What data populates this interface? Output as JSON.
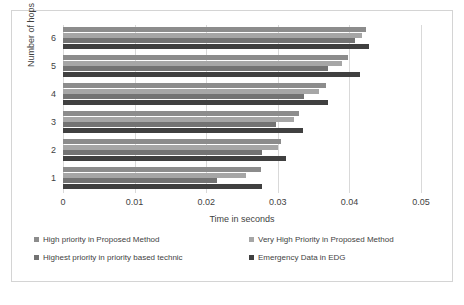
{
  "chart_data": {
    "type": "bar",
    "orientation": "horizontal",
    "title": "",
    "xlabel": "Time in seconds",
    "ylabel": "Number  of hops",
    "categories": [
      "1",
      "2",
      "3",
      "4",
      "5",
      "6"
    ],
    "xlim": [
      0,
      0.05
    ],
    "xticks": [
      "0",
      "0.01",
      "0.02",
      "0.03",
      "0.04",
      "0.05"
    ],
    "xtick_values": [
      0,
      0.01,
      0.02,
      0.03,
      0.04,
      0.05
    ],
    "grid": true,
    "legend_position": "bottom",
    "series": [
      {
        "name": "High priority in Proposed Method",
        "color": "#8c8c8c",
        "values": [
          0.0277,
          0.0305,
          0.033,
          0.0368,
          0.0398,
          0.0423
        ]
      },
      {
        "name": "Very High Priority in Proposed Method",
        "color": "#a6a6a6",
        "values": [
          0.0255,
          0.03,
          0.0323,
          0.0358,
          0.039,
          0.0418
        ]
      },
      {
        "name": "Highest priority in priority based technic",
        "color": "#737373",
        "values": [
          0.0215,
          0.0278,
          0.0298,
          0.0337,
          0.037,
          0.0408
        ]
      },
      {
        "name": "Emergency Data in EDG",
        "color": "#404040",
        "values": [
          0.0278,
          0.0312,
          0.0335,
          0.037,
          0.0415,
          0.0428
        ]
      }
    ]
  }
}
